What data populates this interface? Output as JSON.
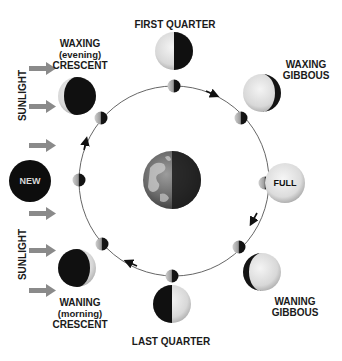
{
  "sunlight": {
    "label_top": "SUNLIGHT",
    "label_bottom": "SUNLIGHT",
    "arrow_color": "#8a8a8a",
    "arrow_count": 6
  },
  "center": {
    "name": "Earth"
  },
  "orbit": {
    "direction": "counterclockwise-as-drawn (top→right→bottom→left)"
  },
  "phases": [
    {
      "id": "new",
      "label": "NEW",
      "label_inside": true
    },
    {
      "id": "waxing-crescent",
      "label_lines": [
        "WAXING",
        "(evening)",
        "CRESCENT"
      ]
    },
    {
      "id": "first-quarter",
      "label_lines": [
        "FIRST QUARTER"
      ]
    },
    {
      "id": "waxing-gibbous",
      "label_lines": [
        "WAXING",
        "GIBBOUS"
      ]
    },
    {
      "id": "full",
      "label": "FULL",
      "label_inside": true
    },
    {
      "id": "waning-gibbous",
      "label_lines": [
        "WANING",
        "GIBBOUS"
      ]
    },
    {
      "id": "last-quarter",
      "label_lines": [
        "LAST QUARTER"
      ]
    },
    {
      "id": "waning-crescent",
      "label_lines": [
        "WANING",
        "(morning)",
        "CRESCENT"
      ]
    }
  ],
  "colors": {
    "dark": "#111111",
    "lit": "#e6e6e6",
    "orbit_line": "#555555",
    "text": "#1a1a1a"
  }
}
